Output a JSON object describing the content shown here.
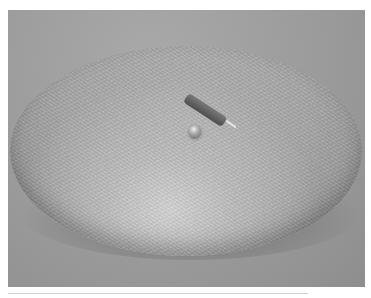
{
  "image": {
    "description": "Grayscale photograph of a large textured dome-shaped object resting on a gray surface, with a small dark cylindrical component and a small shiny bead on top",
    "colors": {
      "background": "#ffffff",
      "surface": "#9a9a9a",
      "dome": "#b0b0b0",
      "cylinder": "#5a5a5a"
    }
  }
}
